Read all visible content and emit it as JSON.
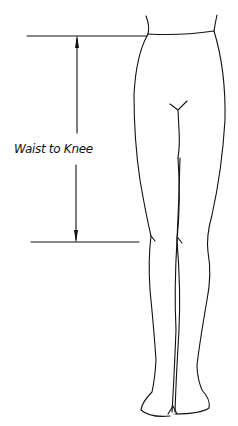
{
  "diagram": {
    "type": "measurement-illustration",
    "measurement_label": "Waist to Knee",
    "line_color": "#111111",
    "background": "#ffffff",
    "markers": {
      "top_line": "waist",
      "bottom_line": "knee"
    }
  }
}
